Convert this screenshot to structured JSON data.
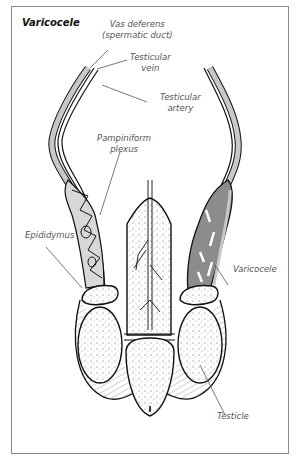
{
  "title": "Varicocele",
  "labels": {
    "vas_deferens": [
      "Vas deferens",
      "(spermatic duct)"
    ],
    "testicular_vein": [
      "Testicular",
      "vein"
    ],
    "testicular_artery": [
      "Testicular",
      "artery"
    ],
    "pampiniform_plexus": [
      "Pampiniform",
      "plexus"
    ],
    "epididymus": "Epididymus",
    "varicocele": "Varicocele",
    "testicle": "Testicle"
  },
  "colors": {
    "outline": "#111111",
    "varicocele_fill": "#8c8c8c",
    "cord_fill": "#c8c8c8",
    "label_text": "#555555",
    "leader_line": "#555555"
  }
}
